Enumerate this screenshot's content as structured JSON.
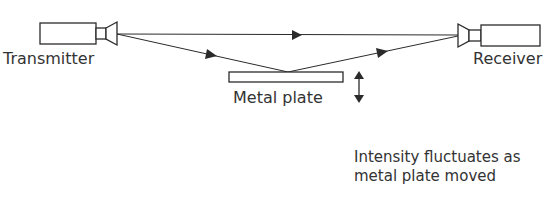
{
  "diagram": {
    "transmitter_label": "Transmitter",
    "receiver_label": "Receiver",
    "plate_label": "Metal plate",
    "note_line1": "Intensity fluctuates as",
    "note_line2": "metal plate moved",
    "stroke_color": "#2b2b2b",
    "background": "#ffffff"
  }
}
